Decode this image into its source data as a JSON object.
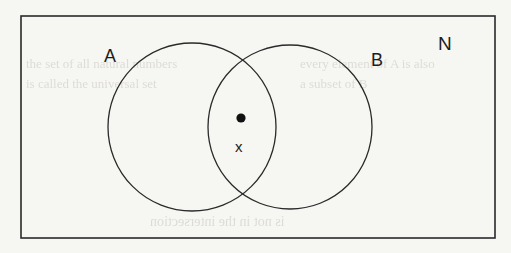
{
  "figure": {
    "kind": "venn-diagram",
    "background_color": "#f6f6f3",
    "stroke_color": "#2a2a2a",
    "universal_set": {
      "label": "N",
      "shape": "rectangle",
      "x": 21,
      "y": 16,
      "width": 474,
      "height": 222,
      "stroke_width": 1.6,
      "label_x": 445,
      "label_y": 43
    },
    "sets": [
      {
        "label": "A",
        "shape": "circle",
        "cx": 192,
        "cy": 127,
        "r": 84,
        "stroke_width": 1.3,
        "fill": "none",
        "label_x": 111,
        "label_y": 55
      },
      {
        "label": "B",
        "shape": "circle",
        "cx": 290,
        "cy": 127,
        "r": 82,
        "stroke_width": 1.3,
        "fill": "none",
        "label_x": 377,
        "label_y": 59
      }
    ],
    "points": [
      {
        "label": "x",
        "marker": "filled-dot",
        "cx": 241,
        "cy": 118,
        "r": 4.6,
        "fill": "#111111",
        "region": "A-intersect-B",
        "label_x": 241,
        "label_y": 147
      }
    ],
    "ghost_text": [
      {
        "text": "the set of all natural numbers",
        "x": 26,
        "y": 64,
        "size": 13,
        "flip": false
      },
      {
        "text": "is called the universal set",
        "x": 26,
        "y": 84,
        "size": 13,
        "flip": false
      },
      {
        "text": "every element of A is also",
        "x": 300,
        "y": 64,
        "size": 13,
        "flip": false
      },
      {
        "text": "a subset of B",
        "x": 300,
        "y": 84,
        "size": 13,
        "flip": false
      },
      {
        "text": "is not in the intersection",
        "x": 150,
        "y": 222,
        "size": 14,
        "flip": true
      }
    ]
  }
}
